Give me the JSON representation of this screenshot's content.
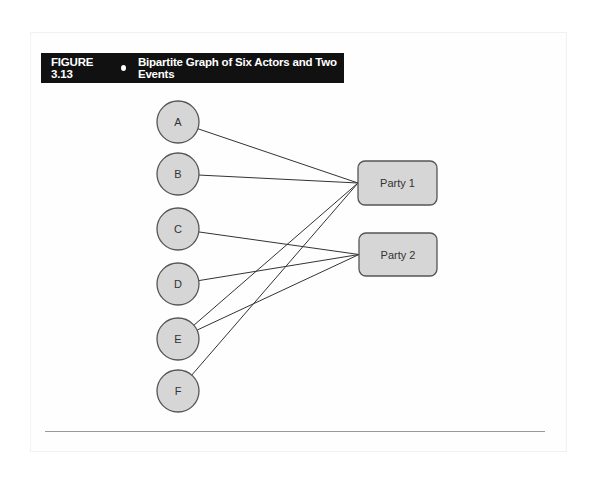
{
  "figure": {
    "number": "FIGURE 3.13",
    "title": "Bipartite Graph of Six Actors and Two Events"
  },
  "actors": [
    {
      "label": "A",
      "cx": 178,
      "cy": 122
    },
    {
      "label": "B",
      "cx": 178,
      "cy": 174
    },
    {
      "label": "C",
      "cx": 178,
      "cy": 229
    },
    {
      "label": "D",
      "cx": 178,
      "cy": 284
    },
    {
      "label": "E",
      "cx": 178,
      "cy": 339
    },
    {
      "label": "F",
      "cx": 178,
      "cy": 391
    }
  ],
  "events": [
    {
      "label": "Party 1",
      "x": 358,
      "y": 161,
      "w": 79,
      "h": 44
    },
    {
      "label": "Party 2",
      "x": 359,
      "y": 233,
      "w": 78,
      "h": 43
    }
  ],
  "edges": [
    {
      "from": "A",
      "to": "Party 1"
    },
    {
      "from": "B",
      "to": "Party 1"
    },
    {
      "from": "E",
      "to": "Party 1"
    },
    {
      "from": "F",
      "to": "Party 1"
    },
    {
      "from": "C",
      "to": "Party 2"
    },
    {
      "from": "D",
      "to": "Party 2"
    },
    {
      "from": "E",
      "to": "Party 2"
    }
  ],
  "colors": {
    "node_fill": "#d6d6d6",
    "node_stroke": "#555555",
    "edge": "#333333",
    "title_bg": "#111111"
  }
}
